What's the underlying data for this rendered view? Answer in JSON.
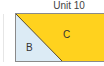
{
  "diagram": {
    "title": "Unit 10",
    "regions": [
      {
        "label": "B",
        "color": "#dcebf5",
        "shape": "triangle"
      },
      {
        "label": "C",
        "color": "#ffd21e",
        "shape": "trapezoid"
      }
    ],
    "outline_color": "#8a8a8a"
  }
}
